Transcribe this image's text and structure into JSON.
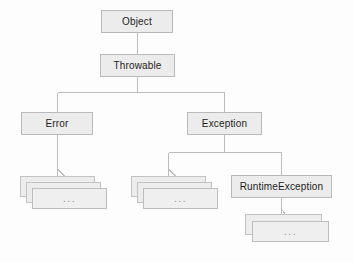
{
  "diagram": {
    "background_color": "#fdfdfd",
    "node_fill_color": "#ececec",
    "node_border_color": "#b9b9b9",
    "edge_color": "#bcbcbc",
    "ellipsis_text": "...",
    "nodes": [
      {
        "id": "object",
        "label": "Object",
        "x": 101,
        "y": 10,
        "w": 72,
        "h": 23
      },
      {
        "id": "throwable",
        "label": "Throwable",
        "x": 100,
        "y": 54,
        "w": 75,
        "h": 23
      },
      {
        "id": "error",
        "label": "Error",
        "x": 21,
        "y": 112,
        "w": 72,
        "h": 23
      },
      {
        "id": "exception",
        "label": "Exception",
        "x": 187,
        "y": 112,
        "w": 75,
        "h": 23
      },
      {
        "id": "runtimeexception",
        "label": "RuntimeException",
        "x": 231,
        "y": 175,
        "w": 101,
        "h": 23
      }
    ],
    "stacks": [
      {
        "id": "error-subclasses",
        "parent": "error",
        "cards": 3,
        "x": 20,
        "y": 176,
        "w": 75,
        "h": 21,
        "offset_x": 6,
        "offset_y": 6
      },
      {
        "id": "exception-subclasses",
        "parent": "exception",
        "cards": 3,
        "x": 131,
        "y": 176,
        "w": 75,
        "h": 21,
        "offset_x": 6,
        "offset_y": 6
      },
      {
        "id": "runtimeexception-subclasses",
        "parent": "runtimeexception",
        "cards": 2,
        "x": 245,
        "y": 214,
        "w": 77,
        "h": 21,
        "offset_x": 7,
        "offset_y": 7
      }
    ],
    "edges": [
      {
        "id": "object-to-throwable",
        "from": "object",
        "to": "throwable"
      },
      {
        "id": "throwable-to-error",
        "from": "throwable",
        "to": "error"
      },
      {
        "id": "throwable-to-exception",
        "from": "throwable",
        "to": "exception"
      },
      {
        "id": "error-to-subclasses",
        "from": "error",
        "to": "error-subclasses"
      },
      {
        "id": "exception-to-subclasses",
        "from": "exception",
        "to": "exception-subclasses"
      },
      {
        "id": "exception-to-runtimeexception",
        "from": "exception",
        "to": "runtimeexception"
      },
      {
        "id": "runtimeexception-to-subclasses",
        "from": "runtimeexception",
        "to": "runtimeexception-subclasses"
      }
    ]
  }
}
